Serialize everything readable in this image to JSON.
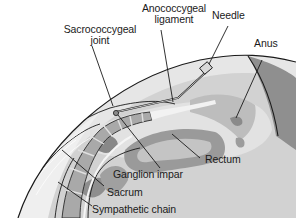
{
  "diagram": {
    "type": "anatomical-illustration",
    "labels": {
      "sacrococcygeal_joint_1": "Sacrococcygeal",
      "sacrococcygeal_joint_2": "joint",
      "anococcygeal_ligament_1": "Anococcygeal",
      "anococcygeal_ligament_2": "ligament",
      "needle": "Needle",
      "anus": "Anus",
      "ganglion_impar": "Ganglion impar",
      "rectum": "Rectum",
      "sacrum": "Sacrum",
      "sympathetic_chain": "Sympathetic chain"
    },
    "colors": {
      "outline": "#1a1a1a",
      "skin_dark": "#8c8c8c",
      "tissue_mid": "#b8b8b8",
      "tissue_light": "#d6d6d6",
      "tissue_pale": "#e8e8e8",
      "bone": "#a6a6a6",
      "rectum_wall": "#9a9a9a",
      "background": "#ffffff"
    }
  }
}
